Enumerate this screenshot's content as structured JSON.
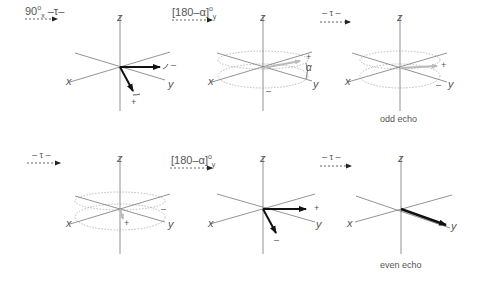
{
  "diagram": {
    "rows": [
      {
        "row": "top",
        "steps": [
          {
            "pulse_main": "90",
            "pulse_sup": "o",
            "pulse_sub": "x",
            "pulse_tail": " –τ–"
          },
          {
            "pulse_main": "[180–α]",
            "pulse_sup": "o",
            "pulse_sub": "y",
            "pulse_tail": ""
          },
          {
            "pulse_main": "– τ –",
            "pulse_sup": "",
            "pulse_sub": "",
            "pulse_tail": ""
          }
        ],
        "panels": [
          {
            "z": "z",
            "x": "x",
            "y": "y",
            "signs": [
              "–",
              "+"
            ]
          },
          {
            "z": "z",
            "x": "x",
            "y": "y",
            "signs": [
              "+",
              "–"
            ],
            "angle": "α"
          },
          {
            "z": "z",
            "x": "x",
            "y": "y",
            "signs": [
              "+",
              "–"
            ],
            "caption": "odd echo"
          }
        ]
      },
      {
        "row": "bottom",
        "steps": [
          {
            "pulse_main": "– τ –",
            "pulse_sup": "",
            "pulse_sub": "",
            "pulse_tail": ""
          },
          {
            "pulse_main": "[180–α]",
            "pulse_sup": "o",
            "pulse_sub": "y",
            "pulse_tail": ""
          },
          {
            "pulse_main": "– τ –",
            "pulse_sup": "",
            "pulse_sub": "",
            "pulse_tail": ""
          }
        ],
        "panels": [
          {
            "z": "z",
            "x": "x",
            "y": "y",
            "signs": [
              "–",
              "+"
            ]
          },
          {
            "z": "z",
            "x": "x",
            "y": "y",
            "signs": [
              "+",
              "–"
            ]
          },
          {
            "z": "z",
            "x": "x",
            "y": "y",
            "signs": [],
            "caption": "even echo"
          }
        ]
      }
    ],
    "colors": {
      "axis": "#777777",
      "vector": "#111111",
      "dashed": "#999999",
      "text": "#555555"
    }
  }
}
